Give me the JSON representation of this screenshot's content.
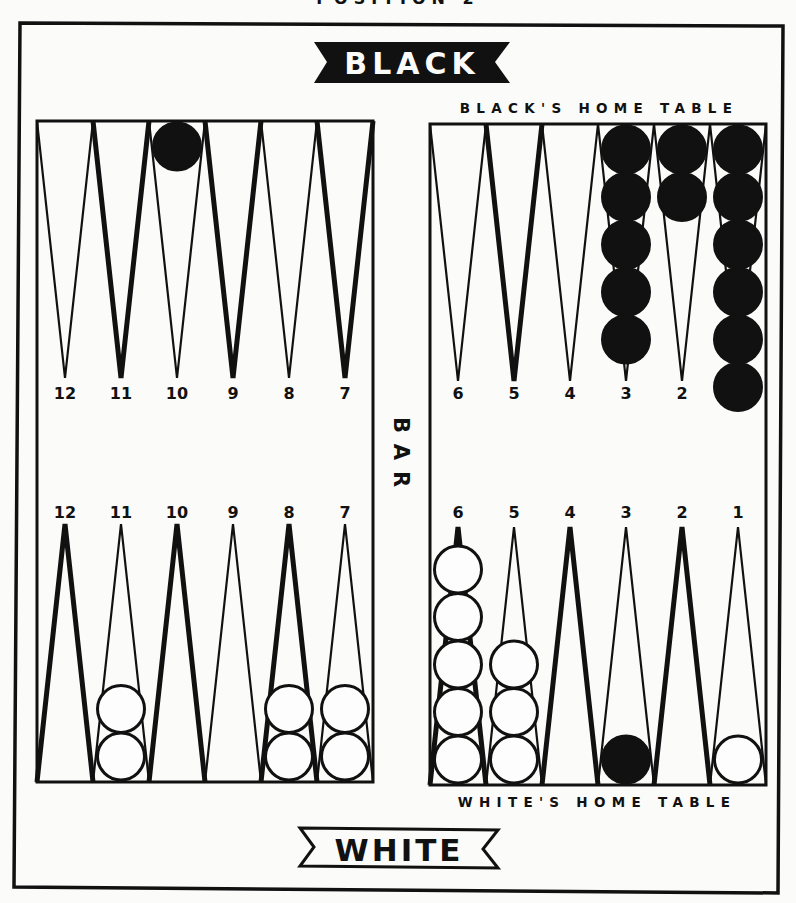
{
  "title": "POSITION 2",
  "colors": {
    "paper": "#fbfbfa",
    "ink": "#111111",
    "white_checker_fill": "#fdfdfd",
    "black_checker_fill": "#111111"
  },
  "banners": {
    "top": {
      "label": "BLACK",
      "style": "filled"
    },
    "bottom": {
      "label": "WHITE",
      "style": "outlined"
    }
  },
  "bar_label": "BAR",
  "table_labels": {
    "black_home": "BLACK'S HOME TABLE",
    "white_home": "WHITE'S HOME TABLE"
  },
  "board": {
    "top_left": {
      "labels": [
        "12",
        "11",
        "10",
        "9",
        "8",
        "7"
      ],
      "thick": [
        false,
        true,
        false,
        true,
        false,
        true
      ]
    },
    "top_right": {
      "labels": [
        "6",
        "5",
        "4",
        "3",
        "2",
        ""
      ],
      "thick": [
        false,
        true,
        false,
        false,
        false,
        false
      ]
    },
    "bottom_left": {
      "labels": [
        "12",
        "11",
        "10",
        "9",
        "8",
        "7"
      ],
      "thick": [
        true,
        false,
        true,
        false,
        true,
        false
      ]
    },
    "bottom_right": {
      "labels": [
        "6",
        "5",
        "4",
        "3",
        "2",
        "1"
      ],
      "thick": [
        true,
        false,
        true,
        false,
        true,
        false
      ]
    }
  },
  "checkers": {
    "top_left": [
      {
        "point": "10",
        "color": "black",
        "count": 1
      }
    ],
    "top_right": [
      {
        "point": "3",
        "color": "black",
        "count": 5
      },
      {
        "point": "2",
        "color": "black",
        "count": 2
      },
      {
        "point": "1",
        "color": "black",
        "count": 6
      }
    ],
    "bottom_left": [
      {
        "point": "11",
        "color": "white",
        "count": 2
      },
      {
        "point": "8",
        "color": "white",
        "count": 2
      },
      {
        "point": "7",
        "color": "white",
        "count": 2
      }
    ],
    "bottom_right": [
      {
        "point": "6",
        "color": "white",
        "count": 5
      },
      {
        "point": "5",
        "color": "white",
        "count": 3
      },
      {
        "point": "3",
        "color": "black",
        "count": 1
      },
      {
        "point": "1",
        "color": "white",
        "count": 1
      }
    ]
  }
}
